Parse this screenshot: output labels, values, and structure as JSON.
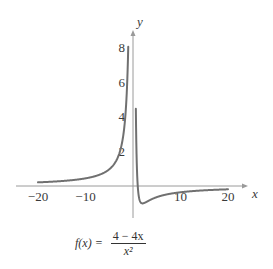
{
  "chart_data": {
    "type": "line",
    "title": "",
    "function": "f(x) = (4 - 4x) / x^2",
    "caption": {
      "lhs": "f(x) =",
      "numerator": "4 − 4x",
      "denominator": "x²"
    },
    "xlabel": "x",
    "ylabel": "y",
    "xlim": [
      -20,
      20
    ],
    "ylim": [
      -0.5,
      8
    ],
    "x_ticks": [
      -20,
      -10,
      10,
      20
    ],
    "x_tick_labels": [
      "−20",
      "−10",
      "10",
      "20"
    ],
    "y_ticks": [
      2,
      4,
      6,
      8
    ],
    "y_tick_labels": [
      "2",
      "4",
      "6",
      "8"
    ],
    "grid": false,
    "legend": null,
    "vertical_asymptote": 0,
    "horizontal_asymptote": 0,
    "minimum": {
      "x": 2,
      "y": -0.25
    },
    "series": [
      {
        "name": "f(x) left branch",
        "x": [
          -20,
          -15,
          -10,
          -7,
          -5,
          -4,
          -3,
          -2.5,
          -2,
          -1.5,
          -1.3,
          -1.2,
          -1.1
        ],
        "y": [
          0.21,
          0.284,
          0.44,
          0.653,
          0.96,
          1.25,
          1.78,
          2.24,
          3.0,
          4.44,
          5.44,
          6.11,
          6.94
        ]
      },
      {
        "name": "f(x) right branch",
        "x": [
          0.68,
          0.7,
          0.75,
          0.8,
          0.9,
          1,
          1.5,
          2,
          3,
          4,
          5,
          7,
          10,
          15,
          20
        ],
        "y": [
          2.77,
          2.45,
          1.78,
          1.25,
          0.49,
          0,
          -0.44,
          -0.25,
          -0.89,
          -0.75,
          -0.64,
          -0.49,
          -0.36,
          -0.249,
          -0.19
        ]
      }
    ],
    "line_color": "#707070",
    "axis_color": "#9a9a9a"
  }
}
